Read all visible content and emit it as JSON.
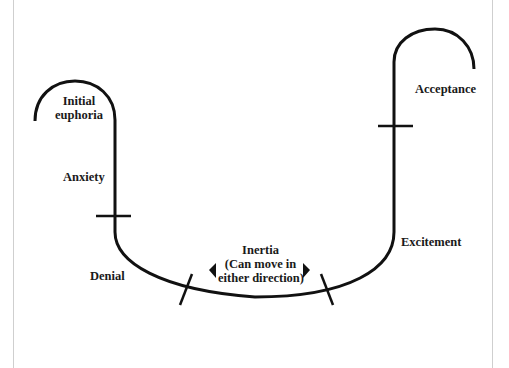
{
  "diagram": {
    "type": "change-curve",
    "stages": [
      {
        "id": "initial-euphoria",
        "label_line1": "Initial",
        "label_line2": "euphoria"
      },
      {
        "id": "anxiety",
        "label": "Anxiety"
      },
      {
        "id": "denial",
        "label": "Denial"
      },
      {
        "id": "inertia",
        "label_line1": "Inertia",
        "label_line2": "(Can move in",
        "label_line3": "either direction)"
      },
      {
        "id": "excitement",
        "label": "Excitement"
      },
      {
        "id": "acceptance",
        "label": "Acceptance"
      }
    ],
    "colors": {
      "line": "#111111",
      "text": "#222222",
      "border": "#cfcfcf"
    }
  }
}
